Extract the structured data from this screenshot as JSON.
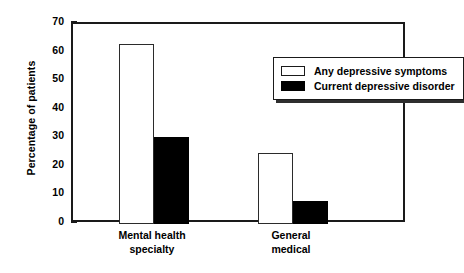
{
  "chart_data": {
    "type": "bar",
    "title": "",
    "xlabel": "",
    "ylabel": "Percentage of patients",
    "ylim": [
      0,
      70
    ],
    "yticks": [
      0,
      10,
      20,
      30,
      40,
      50,
      60,
      70
    ],
    "ytick_labels": [
      "0",
      "10",
      "20",
      "30",
      "40",
      "50",
      "60",
      "70"
    ],
    "grid": false,
    "legend_position": "top-right-inside",
    "categories": [
      "Mental health\nspecialty",
      "General\nmedical"
    ],
    "series": [
      {
        "name": "Any depressive symptoms",
        "fill": "#ffffff",
        "edge": "#2b2b2b",
        "values": [
          63,
          25
        ]
      },
      {
        "name": "Current depressive disorder",
        "fill": "#000000",
        "edge": "#000000",
        "values": [
          30.5,
          8
        ]
      }
    ]
  },
  "legend": {
    "items": [
      {
        "label": "Any depressive symptoms"
      },
      {
        "label": "Current depressive disorder"
      }
    ]
  }
}
